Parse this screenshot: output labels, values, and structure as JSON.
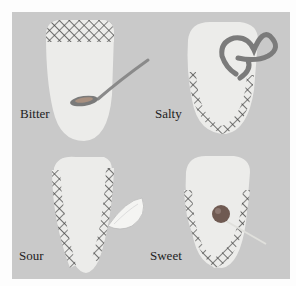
{
  "figure": {
    "panels": [
      {
        "id": "bitter",
        "label": "Bitter",
        "region": "back of tongue",
        "object": "spoon"
      },
      {
        "id": "salty",
        "label": "Salty",
        "region": "sides and tip",
        "object": "pretzel"
      },
      {
        "id": "sour",
        "label": "Sour",
        "region": "sides",
        "object": "lemon wedge"
      },
      {
        "id": "sweet",
        "label": "Sweet",
        "region": "tip",
        "object": "lollipop"
      }
    ]
  },
  "colors": {
    "background": "#fdfdfd",
    "panel": "#c9c9c9",
    "tongue": "#ececea",
    "hatch": "#4a4a4a"
  }
}
